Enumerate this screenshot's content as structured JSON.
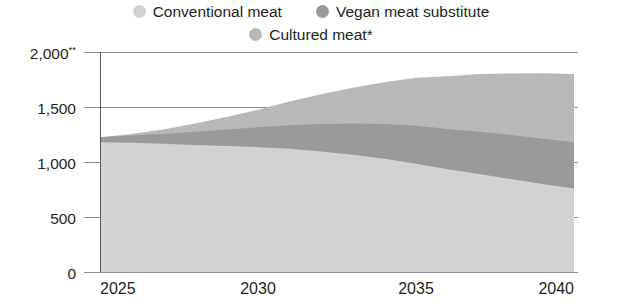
{
  "legend": {
    "rows": [
      [
        {
          "label": "Conventional meat",
          "color": "#d2d2d2",
          "icon": "legend-dot-icon"
        },
        {
          "label": "Vegan meat substitute",
          "color": "#9a9a9a",
          "icon": "legend-dot-icon"
        }
      ],
      [
        {
          "label": "Cultured meat*",
          "color": "#b8b8b8",
          "icon": "legend-dot-icon"
        }
      ]
    ]
  },
  "axes": {
    "y_ticks": [
      {
        "label": "2,000",
        "sup": "**",
        "value": 2000
      },
      {
        "label": "1,500",
        "sup": "",
        "value": 1500
      },
      {
        "label": "1,000",
        "sup": "",
        "value": 1000
      },
      {
        "label": "500",
        "sup": "",
        "value": 500
      },
      {
        "label": "0",
        "sup": "",
        "value": 0
      }
    ],
    "x_ticks": [
      {
        "label": "2025",
        "value": 2025
      },
      {
        "label": "2030",
        "value": 2030
      },
      {
        "label": "2035",
        "value": 2035
      },
      {
        "label": "2040",
        "value": 2040
      }
    ]
  },
  "chart_data": {
    "type": "area",
    "stacked": true,
    "title": "",
    "subtitle": "",
    "xlabel": "",
    "ylabel": "",
    "xlim": [
      2025,
      2040
    ],
    "ylim": [
      0,
      2000
    ],
    "grid": true,
    "legend_position": "top",
    "x": [
      2025,
      2026,
      2027,
      2028,
      2029,
      2030,
      2031,
      2032,
      2033,
      2034,
      2035,
      2036,
      2037,
      2038,
      2039,
      2040
    ],
    "series": [
      {
        "name": "Conventional meat",
        "color": "#d2d2d2",
        "stack_order": 0,
        "values": [
          1180,
          1175,
          1165,
          1155,
          1145,
          1135,
          1120,
          1095,
          1065,
          1030,
          985,
          935,
          890,
          845,
          800,
          760
        ]
      },
      {
        "name": "Vegan meat substitute",
        "color": "#9a9a9a",
        "stack_order": 1,
        "values": [
          45,
          65,
          90,
          120,
          150,
          180,
          215,
          250,
          285,
          315,
          345,
          365,
          385,
          400,
          412,
          420
        ]
      },
      {
        "name": "Cultured meat*",
        "color": "#b8b8b8",
        "stack_order": 2,
        "values": [
          0,
          15,
          40,
          75,
          115,
          160,
          215,
          270,
          325,
          380,
          435,
          480,
          525,
          560,
          595,
          620
        ]
      }
    ],
    "totals": [
      1225,
      1255,
      1295,
      1350,
      1410,
      1475,
      1550,
      1615,
      1675,
      1725,
      1765,
      1780,
      1800,
      1805,
      1807,
      1800
    ]
  }
}
